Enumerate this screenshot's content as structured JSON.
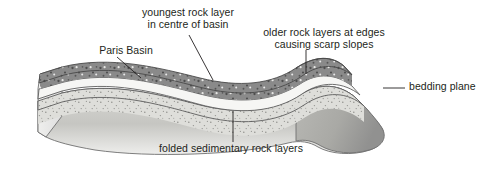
{
  "diagram": {
    "type": "geological-block-diagram",
    "background_color": "#ffffff",
    "ink_color": "#231f20"
  },
  "labels": {
    "youngest": {
      "line1": "youngest rock layer",
      "line2": "in centre of basin"
    },
    "older": {
      "line1": "older rock layers at edges",
      "line2": "causing scarp slopes"
    },
    "paris_basin": "Paris Basin",
    "bedding_plane": "bedding plane",
    "folded": "folded sedimentary rock layers"
  },
  "strata": [
    {
      "name": "youngest-dark-layer",
      "description": "dark grey speckled uppermost rock layer forming centre of basin",
      "fill": "#8a8a8a",
      "speckle": true
    },
    {
      "name": "white-band-layer",
      "description": "pale white limestone band beneath youngest layer",
      "fill": "#f4f4f2",
      "speckle": false
    },
    {
      "name": "light-speckled-layer",
      "description": "light grey finely speckled sandstone band",
      "fill": "#dcdcd8",
      "speckle": true
    },
    {
      "name": "basal-layer",
      "description": "oldest basal rock layer, graded grey front face of block",
      "fill": "#c9c9c5",
      "speckle": false
    }
  ],
  "leader_lines": [
    {
      "name": "leader-youngest",
      "from_label": "youngest",
      "style": "diagonal"
    },
    {
      "name": "leader-older",
      "from_label": "older",
      "style": "vertical"
    },
    {
      "name": "leader-paris-basin",
      "from_label": "paris_basin",
      "style": "diagonal"
    },
    {
      "name": "leader-bedding-plane",
      "from_label": "bedding_plane",
      "style": "horizontal"
    },
    {
      "name": "leader-folded",
      "from_label": "folded",
      "style": "vertical"
    }
  ]
}
